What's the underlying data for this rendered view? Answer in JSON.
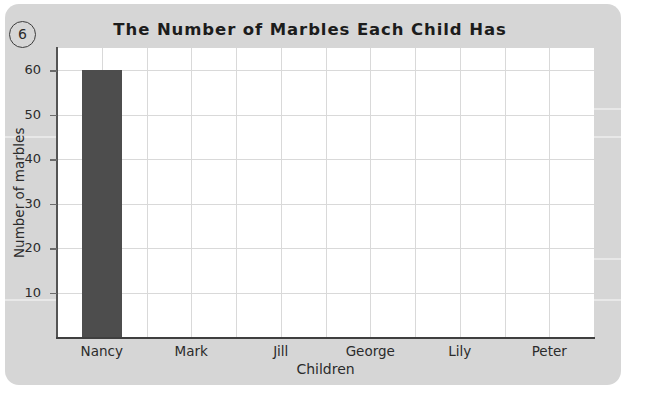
{
  "worksheet": {
    "question_number": "6",
    "card_color": "#d6d6d6",
    "page_color": "#ffffff"
  },
  "chart_data": {
    "type": "bar",
    "title": "The Number of Marbles Each Child Has",
    "xlabel": "Children",
    "ylabel": "Number of marbles",
    "categories": [
      "Nancy",
      "Mark",
      "Jill",
      "George",
      "Lily",
      "Peter"
    ],
    "values": [
      60,
      0,
      0,
      0,
      0,
      0
    ],
    "ylim": [
      0,
      65
    ],
    "yticks": [
      10,
      20,
      30,
      40,
      50,
      60
    ],
    "ytick_labels": [
      "10",
      "20",
      "30",
      "40",
      "50",
      "60"
    ],
    "grid": true,
    "grid_color": "#d9d9d9",
    "bar_color": "#4d4d4d",
    "legend": null,
    "series": [
      {
        "name": "Number of marbles",
        "values": [
          60,
          0,
          0,
          0,
          0,
          0
        ]
      }
    ]
  }
}
